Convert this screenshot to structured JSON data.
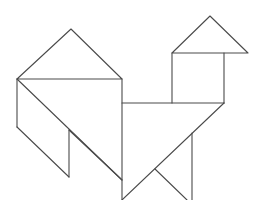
{
  "figure": {
    "stroke_color": "#4a4a4a",
    "background_color": "#ffffff",
    "pieces": [
      {
        "name": "large-triangle-top",
        "kind": "triangle"
      },
      {
        "name": "large-triangle-body",
        "kind": "triangle"
      },
      {
        "name": "parallelogram-left",
        "kind": "parallelogram"
      },
      {
        "name": "parallelogram-mid",
        "kind": "parallelogram"
      },
      {
        "name": "square-neck",
        "kind": "square"
      },
      {
        "name": "small-triangle-head",
        "kind": "triangle"
      },
      {
        "name": "medium-triangle-leg",
        "kind": "triangle"
      }
    ]
  }
}
